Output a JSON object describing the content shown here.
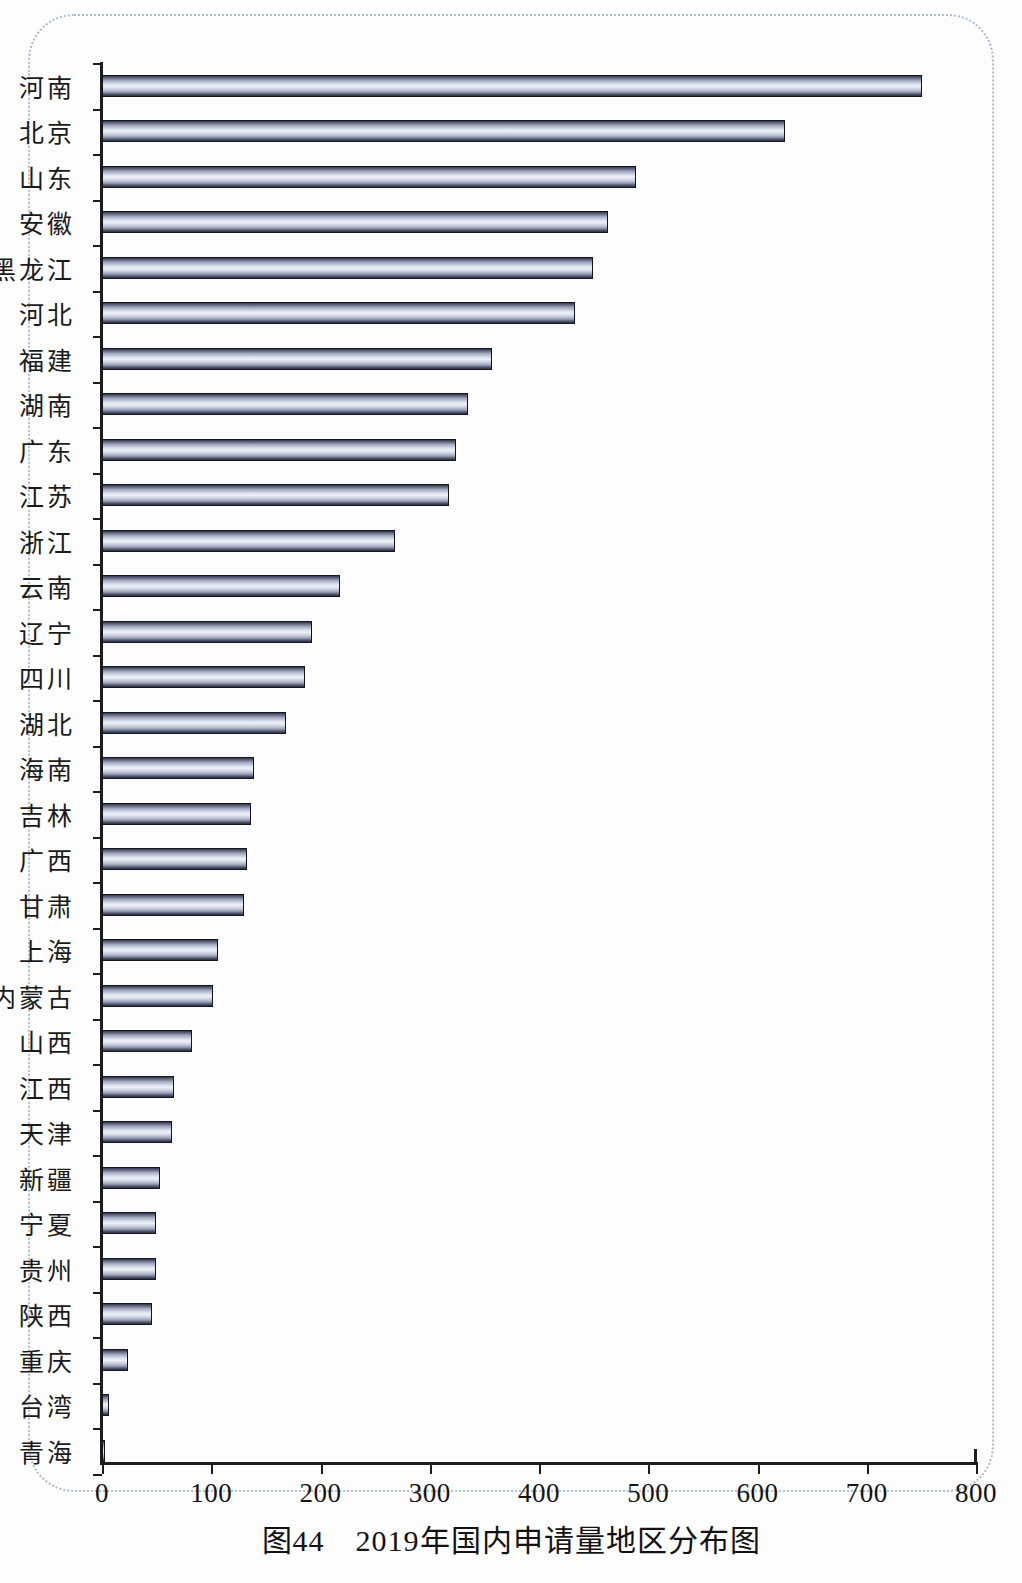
{
  "caption": "图44　2019年国内申请量地区分布图",
  "chart_data": {
    "type": "bar",
    "orientation": "horizontal",
    "title": "图44　2019年国内申请量地区分布图",
    "xlabel": "",
    "ylabel": "",
    "xlim": [
      0,
      800
    ],
    "xticks": [
      "0",
      "100",
      "200",
      "300",
      "400",
      "500",
      "600",
      "700",
      "800"
    ],
    "xtick_values": [
      0,
      100,
      200,
      300,
      400,
      500,
      600,
      700,
      800
    ],
    "grid": false,
    "legend": false,
    "categories": [
      "河南",
      "北京",
      "山东",
      "安徽",
      "黑龙江",
      "河北",
      "福建",
      "湖南",
      "广东",
      "江苏",
      "浙江",
      "云南",
      "辽宁",
      "四川",
      "湖北",
      "海南",
      "吉林",
      "广西",
      "甘肃",
      "上海",
      "内蒙古",
      "山西",
      "江西",
      "天津",
      "新疆",
      "宁夏",
      "贵州",
      "陕西",
      "重庆",
      "台湾",
      "青海"
    ],
    "values": [
      751,
      625,
      489,
      463,
      449,
      433,
      357,
      335,
      324,
      318,
      268,
      218,
      192,
      186,
      168,
      139,
      136,
      133,
      130,
      106,
      102,
      82,
      66,
      64,
      53,
      49,
      49,
      46,
      24,
      6,
      2
    ],
    "bar_color_light": "#eef0f7",
    "bar_color_dark": "#2c2f3f",
    "axis_color": "#1d1d1d"
  }
}
